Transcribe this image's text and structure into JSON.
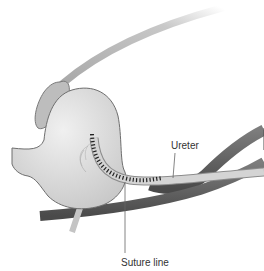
{
  "diagram": {
    "labels": {
      "ureter": "Ureter",
      "suture_line": "Suture line"
    },
    "colors": {
      "background": "#ffffff",
      "bladder_fill": "#d9d9d9",
      "bladder_stroke": "#6e6e6e",
      "vessel_dark": "#555555",
      "vessel_light": "#7a7a7a",
      "ureter_fill": "#cfcfcf",
      "suture": "#222222",
      "leader_line": "#666666",
      "text": "#333333"
    }
  }
}
